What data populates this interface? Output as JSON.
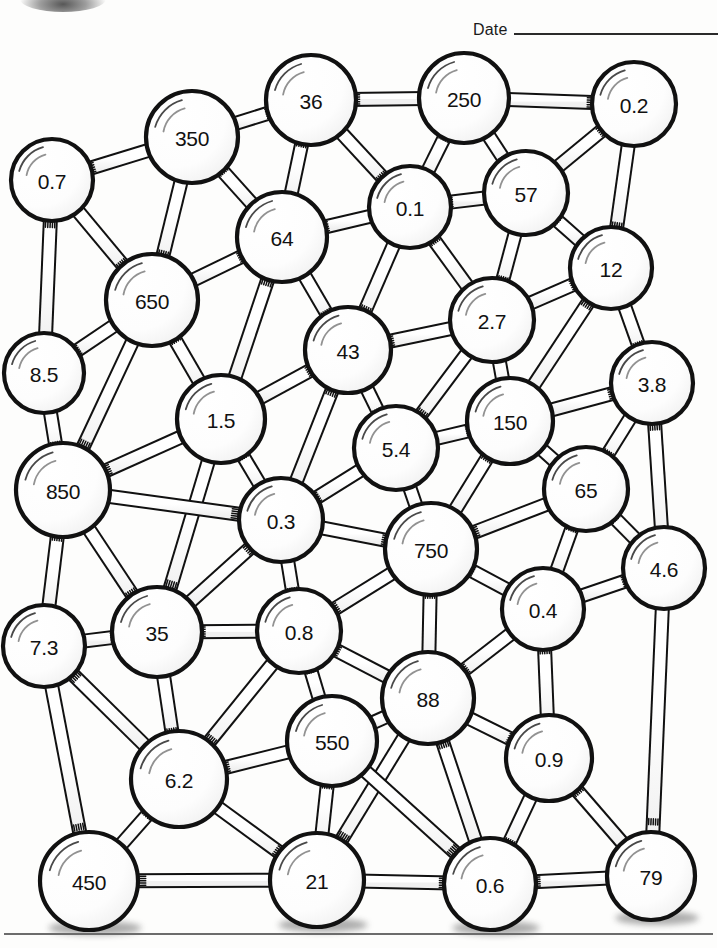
{
  "header": {
    "date_label": "Date",
    "date_value": ""
  },
  "worksheet": {
    "title": "Number Network",
    "ink_color": "#111111",
    "ball_fill": "#ffffff",
    "rod_fill": "#ffffff"
  },
  "graph": {
    "type": "ball-and-stick-network",
    "node_count": 32,
    "edge_count": 71,
    "nodes": [
      {
        "id": "n0",
        "label": "0.7",
        "x": 52,
        "y": 180,
        "r": 41
      },
      {
        "id": "n1",
        "label": "350",
        "x": 192,
        "y": 137,
        "r": 46
      },
      {
        "id": "n2",
        "label": "36",
        "x": 311,
        "y": 100,
        "r": 45
      },
      {
        "id": "n3",
        "label": "250",
        "x": 464,
        "y": 98,
        "r": 45
      },
      {
        "id": "n4",
        "label": "0.2",
        "x": 634,
        "y": 104,
        "r": 42
      },
      {
        "id": "n5",
        "label": "0.1",
        "x": 410,
        "y": 207,
        "r": 41
      },
      {
        "id": "n6",
        "label": "57",
        "x": 526,
        "y": 193,
        "r": 42
      },
      {
        "id": "n7",
        "label": "64",
        "x": 282,
        "y": 237,
        "r": 45
      },
      {
        "id": "n8",
        "label": "650",
        "x": 152,
        "y": 300,
        "r": 46
      },
      {
        "id": "n9",
        "label": "12",
        "x": 611,
        "y": 268,
        "r": 41
      },
      {
        "id": "n10",
        "label": "2.7",
        "x": 492,
        "y": 320,
        "r": 42
      },
      {
        "id": "n11",
        "label": "43",
        "x": 348,
        "y": 350,
        "r": 43
      },
      {
        "id": "n12",
        "label": "8.5",
        "x": 44,
        "y": 373,
        "r": 40
      },
      {
        "id": "n13",
        "label": "3.8",
        "x": 652,
        "y": 383,
        "r": 41
      },
      {
        "id": "n14",
        "label": "1.5",
        "x": 221,
        "y": 419,
        "r": 44
      },
      {
        "id": "n15",
        "label": "150",
        "x": 510,
        "y": 421,
        "r": 43
      },
      {
        "id": "n16",
        "label": "5.4",
        "x": 396,
        "y": 448,
        "r": 42
      },
      {
        "id": "n17",
        "label": "850",
        "x": 63,
        "y": 490,
        "r": 47
      },
      {
        "id": "n18",
        "label": "65",
        "x": 586,
        "y": 489,
        "r": 42
      },
      {
        "id": "n19",
        "label": "0.3",
        "x": 281,
        "y": 520,
        "r": 42
      },
      {
        "id": "n20",
        "label": "4.6",
        "x": 664,
        "y": 568,
        "r": 41
      },
      {
        "id": "n21",
        "label": "750",
        "x": 431,
        "y": 549,
        "r": 46
      },
      {
        "id": "n22",
        "label": "0.4",
        "x": 543,
        "y": 609,
        "r": 41
      },
      {
        "id": "n23",
        "label": "7.3",
        "x": 44,
        "y": 646,
        "r": 41
      },
      {
        "id": "n24",
        "label": "35",
        "x": 157,
        "y": 632,
        "r": 45
      },
      {
        "id": "n25",
        "label": "0.8",
        "x": 299,
        "y": 631,
        "r": 42
      },
      {
        "id": "n26",
        "label": "88",
        "x": 428,
        "y": 698,
        "r": 46
      },
      {
        "id": "n27",
        "label": "0.9",
        "x": 549,
        "y": 758,
        "r": 43
      },
      {
        "id": "n28",
        "label": "550",
        "x": 332,
        "y": 741,
        "r": 45
      },
      {
        "id": "n29",
        "label": "6.2",
        "x": 179,
        "y": 779,
        "r": 48
      },
      {
        "id": "n30",
        "label": "450",
        "x": 89,
        "y": 881,
        "r": 49
      },
      {
        "id": "n31",
        "label": "21",
        "x": 317,
        "y": 880,
        "r": 47
      },
      {
        "id": "n32",
        "label": "0.6",
        "x": 490,
        "y": 884,
        "r": 46
      },
      {
        "id": "n33",
        "label": "79",
        "x": 651,
        "y": 876,
        "r": 44
      }
    ],
    "edges": [
      [
        "n0",
        "n1"
      ],
      [
        "n0",
        "n8"
      ],
      [
        "n0",
        "n12"
      ],
      [
        "n1",
        "n2"
      ],
      [
        "n1",
        "n7"
      ],
      [
        "n1",
        "n8"
      ],
      [
        "n2",
        "n7"
      ],
      [
        "n2",
        "n5"
      ],
      [
        "n2",
        "n3"
      ],
      [
        "n3",
        "n4"
      ],
      [
        "n3",
        "n5"
      ],
      [
        "n3",
        "n6"
      ],
      [
        "n4",
        "n6"
      ],
      [
        "n4",
        "n9"
      ],
      [
        "n5",
        "n6"
      ],
      [
        "n5",
        "n7"
      ],
      [
        "n5",
        "n10"
      ],
      [
        "n5",
        "n11"
      ],
      [
        "n6",
        "n9"
      ],
      [
        "n6",
        "n10"
      ],
      [
        "n7",
        "n8"
      ],
      [
        "n7",
        "n11"
      ],
      [
        "n7",
        "n14"
      ],
      [
        "n8",
        "n12"
      ],
      [
        "n8",
        "n14"
      ],
      [
        "n8",
        "n17"
      ],
      [
        "n9",
        "n10"
      ],
      [
        "n9",
        "n13"
      ],
      [
        "n9",
        "n15"
      ],
      [
        "n10",
        "n11"
      ],
      [
        "n10",
        "n15"
      ],
      [
        "n10",
        "n16"
      ],
      [
        "n11",
        "n14"
      ],
      [
        "n11",
        "n16"
      ],
      [
        "n11",
        "n19"
      ],
      [
        "n12",
        "n17"
      ],
      [
        "n13",
        "n15"
      ],
      [
        "n13",
        "n18"
      ],
      [
        "n13",
        "n20"
      ],
      [
        "n14",
        "n17"
      ],
      [
        "n14",
        "n19"
      ],
      [
        "n14",
        "n24"
      ],
      [
        "n15",
        "n16"
      ],
      [
        "n15",
        "n18"
      ],
      [
        "n15",
        "n21"
      ],
      [
        "n16",
        "n19"
      ],
      [
        "n16",
        "n21"
      ],
      [
        "n17",
        "n19"
      ],
      [
        "n17",
        "n23"
      ],
      [
        "n17",
        "n24"
      ],
      [
        "n18",
        "n20"
      ],
      [
        "n18",
        "n21"
      ],
      [
        "n18",
        "n22"
      ],
      [
        "n19",
        "n21"
      ],
      [
        "n19",
        "n24"
      ],
      [
        "n19",
        "n25"
      ],
      [
        "n20",
        "n22"
      ],
      [
        "n20",
        "n33"
      ],
      [
        "n21",
        "n22"
      ],
      [
        "n21",
        "n25"
      ],
      [
        "n21",
        "n26"
      ],
      [
        "n22",
        "n26"
      ],
      [
        "n22",
        "n27"
      ],
      [
        "n23",
        "n24"
      ],
      [
        "n23",
        "n29"
      ],
      [
        "n23",
        "n30"
      ],
      [
        "n24",
        "n25"
      ],
      [
        "n24",
        "n29"
      ],
      [
        "n25",
        "n28"
      ],
      [
        "n25",
        "n29"
      ],
      [
        "n25",
        "n26"
      ],
      [
        "n26",
        "n27"
      ],
      [
        "n26",
        "n28"
      ],
      [
        "n26",
        "n31"
      ],
      [
        "n26",
        "n32"
      ],
      [
        "n27",
        "n32"
      ],
      [
        "n27",
        "n33"
      ],
      [
        "n28",
        "n29"
      ],
      [
        "n28",
        "n31"
      ],
      [
        "n28",
        "n32"
      ],
      [
        "n29",
        "n30"
      ],
      [
        "n29",
        "n31"
      ],
      [
        "n30",
        "n31"
      ],
      [
        "n31",
        "n32"
      ],
      [
        "n32",
        "n33"
      ]
    ]
  }
}
